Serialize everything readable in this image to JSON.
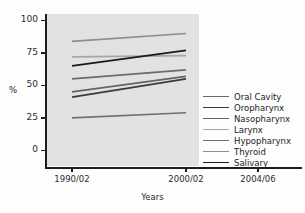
{
  "chart_data": {
    "type": "line",
    "title": "",
    "xlabel": "Years",
    "ylabel": "%",
    "x": [
      "1990/02",
      "2000/02",
      "2004/06"
    ],
    "x_tick_labels": [
      "1990/02",
      "2000/02",
      "2004/06"
    ],
    "y_tick_labels": [
      "0",
      "25",
      "50",
      "75",
      "100"
    ],
    "y_ticks": [
      0,
      25,
      50,
      75,
      100
    ],
    "ylim": [
      -12,
      105
    ],
    "xlim": [
      0,
      2.35
    ],
    "grid": false,
    "legend_position": "right-middle",
    "plot_background": "#e2e2e2",
    "series": [
      {
        "name": "Oral Cavity",
        "color": "#6b6b6b",
        "x": [
          "1990/02",
          "2000/02"
        ],
        "values": [
          55,
          62
        ]
      },
      {
        "name": "Oropharynx",
        "color": "#3a3a3a",
        "x": [
          "1990/02",
          "2000/02"
        ],
        "values": [
          41,
          55
        ]
      },
      {
        "name": "Nasopharynx",
        "color": "#646464",
        "x": [
          "1990/02",
          "2000/02"
        ],
        "values": [
          45,
          57
        ]
      },
      {
        "name": "Larynx",
        "color": "#a6a6a6",
        "x": [
          "1990/02",
          "2000/02"
        ],
        "values": [
          72,
          73
        ]
      },
      {
        "name": "Hypopharynx",
        "color": "#707070",
        "x": [
          "1990/02",
          "2000/02"
        ],
        "values": [
          25,
          29
        ]
      },
      {
        "name": "Thyroid",
        "color": "#8d8d8d",
        "x": [
          "1990/02",
          "2000/02"
        ],
        "values": [
          84,
          90
        ]
      },
      {
        "name": "Salivary",
        "color": "#1a1a1a",
        "x": [
          "1990/02",
          "2000/02"
        ],
        "values": [
          65,
          77
        ]
      }
    ]
  },
  "axes": {
    "y_title": "%",
    "x_title": "Years"
  },
  "legend": {
    "items": [
      {
        "label": "Oral Cavity"
      },
      {
        "label": "Oropharynx"
      },
      {
        "label": "Nasopharynx"
      },
      {
        "label": "Larynx"
      },
      {
        "label": "Hypopharynx"
      },
      {
        "label": "Thyroid"
      },
      {
        "label": "Salivary"
      }
    ]
  }
}
